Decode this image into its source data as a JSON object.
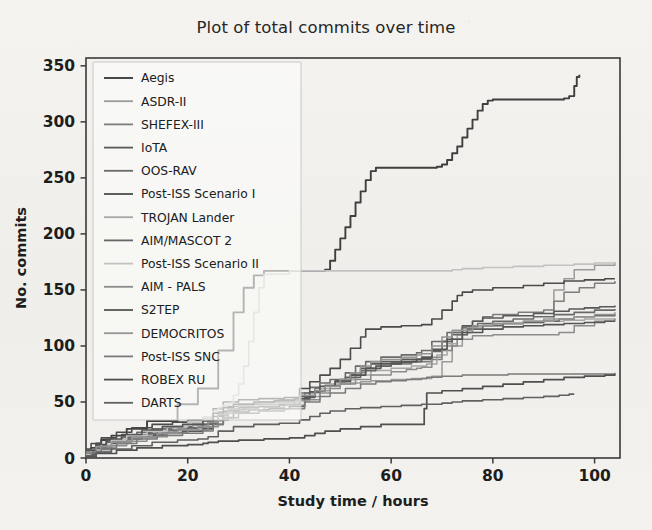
{
  "figure": {
    "title": "Plot of total commits over time",
    "background": "#f2f1ee"
  },
  "chart_data": {
    "type": "line",
    "title": "Plot of total commits over time",
    "xlabel": "Study time / hours",
    "ylabel": "No. commits",
    "xlim": [
      0,
      105
    ],
    "ylim": [
      0,
      357
    ],
    "xticks": [
      0,
      20,
      40,
      60,
      80,
      100
    ],
    "yticks": [
      0,
      50,
      100,
      150,
      200,
      250,
      300,
      350
    ],
    "grid": false,
    "legend_position": "upper left",
    "note": "Cumulative step curves; 15 projects tracked over study hours.",
    "series": [
      {
        "name": "Aegis",
        "color": "#3f3f3f",
        "width": 1.9,
        "x": [
          0,
          1,
          2,
          3,
          5,
          8,
          12,
          18,
          22,
          26,
          29,
          31,
          33,
          35,
          40,
          45,
          47,
          48,
          49,
          50,
          51,
          52,
          53,
          54,
          55,
          56,
          57,
          62,
          66,
          69,
          70,
          71,
          72,
          73,
          74,
          75,
          76,
          77,
          78,
          79,
          80,
          84,
          90,
          94,
          95,
          96,
          96.5,
          97
        ],
        "y": [
          5,
          9,
          13,
          16,
          20,
          26,
          33,
          48,
          62,
          96,
          130,
          152,
          163,
          167,
          167,
          167,
          168,
          176,
          186,
          196,
          206,
          216,
          228,
          238,
          248,
          256,
          259,
          259,
          259,
          260,
          262,
          266,
          272,
          278,
          286,
          294,
          302,
          310,
          316,
          319,
          320,
          320,
          320,
          321,
          323,
          332,
          340,
          342
        ]
      },
      {
        "name": "ASDR-II",
        "color": "#9a9a9a",
        "width": 1.5,
        "x": [
          0,
          1,
          3,
          6,
          9,
          12,
          16,
          20,
          23,
          25,
          27,
          28,
          30,
          33,
          36,
          40,
          44,
          46,
          48,
          50,
          52,
          54,
          56,
          60,
          64,
          68,
          70,
          72,
          74,
          76,
          80,
          86,
          90,
          92,
          94,
          96,
          100,
          104
        ],
        "y": [
          2,
          6,
          11,
          16,
          19,
          21,
          23,
          24,
          27,
          33,
          40,
          44,
          47,
          49,
          50,
          51,
          55,
          60,
          64,
          66,
          67,
          68,
          69,
          70,
          71,
          73,
          86,
          100,
          112,
          118,
          120,
          122,
          124,
          150,
          160,
          168,
          172,
          174
        ]
      },
      {
        "name": "SHEFEX-III",
        "color": "#7d7d7d",
        "width": 1.5,
        "x": [
          0,
          2,
          4,
          7,
          10,
          14,
          18,
          22,
          24,
          26,
          28,
          31,
          34,
          38,
          41,
          43,
          45,
          47,
          50,
          53,
          55,
          57,
          60,
          64,
          68,
          70,
          72,
          74,
          76,
          78,
          80,
          85,
          90,
          92,
          94,
          97,
          100,
          104
        ],
        "y": [
          4,
          9,
          14,
          18,
          21,
          24,
          26,
          28,
          31,
          38,
          43,
          45,
          46,
          47,
          52,
          58,
          62,
          65,
          70,
          76,
          80,
          82,
          84,
          86,
          88,
          96,
          106,
          116,
          122,
          126,
          128,
          130,
          132,
          140,
          148,
          152,
          156,
          158
        ]
      },
      {
        "name": "IoTA",
        "color": "#585858",
        "width": 1.6,
        "x": [
          0,
          2,
          5,
          8,
          11,
          15,
          19,
          23,
          25,
          27,
          29,
          32,
          36,
          40,
          43,
          45,
          47,
          49,
          52,
          54,
          56,
          58,
          62,
          66,
          68,
          70,
          72,
          74,
          76,
          78,
          82,
          88,
          92,
          95,
          98,
          101,
          104
        ],
        "y": [
          3,
          8,
          13,
          17,
          20,
          22,
          24,
          26,
          30,
          36,
          41,
          43,
          44,
          46,
          54,
          60,
          64,
          68,
          74,
          80,
          84,
          86,
          88,
          90,
          96,
          104,
          112,
          118,
          122,
          125,
          127,
          129,
          131,
          133,
          134,
          135,
          136
        ]
      },
      {
        "name": "OOS-RAV",
        "color": "#6a6a6a",
        "width": 1.6,
        "x": [
          0,
          2,
          4,
          7,
          10,
          13,
          17,
          21,
          24,
          26,
          28,
          30,
          34,
          38,
          42,
          44,
          46,
          48,
          51,
          53,
          55,
          58,
          62,
          65,
          66,
          68,
          71,
          74,
          77,
          80,
          84,
          88,
          92,
          96,
          100,
          104
        ],
        "y": [
          6,
          11,
          15,
          19,
          23,
          26,
          28,
          30,
          33,
          41,
          46,
          48,
          50,
          52,
          58,
          63,
          67,
          70,
          76,
          82,
          86,
          90,
          92,
          94,
          96,
          104,
          112,
          117,
          120,
          122,
          124,
          126,
          128,
          130,
          132,
          133
        ]
      },
      {
        "name": "Post-ISS Scenario I",
        "color": "#4b4b4b",
        "width": 1.6,
        "x": [
          0,
          1,
          3,
          6,
          9,
          13,
          17,
          20,
          23,
          25,
          27,
          30,
          34,
          39,
          42,
          44,
          46,
          48,
          50,
          52,
          54,
          55,
          58,
          62,
          66,
          68,
          70,
          72,
          73,
          74,
          76,
          80,
          86,
          90,
          94,
          98,
          102,
          104
        ],
        "y": [
          8,
          13,
          18,
          23,
          27,
          30,
          32,
          34,
          36,
          44,
          50,
          52,
          53,
          54,
          62,
          68,
          74,
          80,
          88,
          98,
          108,
          115,
          117,
          118,
          119,
          124,
          132,
          140,
          145,
          148,
          150,
          152,
          154,
          156,
          158,
          159,
          160,
          160
        ]
      },
      {
        "name": "TROJAN Lander",
        "color": "#a6a6a6",
        "width": 1.5,
        "x": [
          0,
          2,
          5,
          9,
          13,
          17,
          21,
          24,
          26,
          28,
          30,
          33,
          37,
          41,
          44,
          46,
          48,
          50,
          53,
          56,
          60,
          64,
          67,
          69,
          71,
          73,
          75,
          78,
          82,
          86,
          90,
          94,
          98,
          102,
          104
        ],
        "y": [
          5,
          10,
          15,
          20,
          24,
          27,
          29,
          32,
          39,
          44,
          47,
          49,
          50,
          52,
          58,
          62,
          66,
          70,
          74,
          78,
          80,
          82,
          84,
          92,
          102,
          110,
          116,
          119,
          120,
          121,
          122,
          123,
          124,
          124,
          125
        ]
      },
      {
        "name": "AIM/MASCOT 2",
        "color": "#656565",
        "width": 1.6,
        "x": [
          0,
          2,
          4,
          8,
          12,
          16,
          20,
          23,
          25,
          27,
          30,
          34,
          38,
          42,
          45,
          47,
          49,
          51,
          54,
          57,
          60,
          64,
          66,
          68,
          70,
          72,
          75,
          78,
          82,
          86,
          90,
          93,
          96,
          100,
          104
        ],
        "y": [
          4,
          9,
          14,
          19,
          22,
          25,
          27,
          30,
          37,
          42,
          45,
          46,
          48,
          55,
          60,
          64,
          68,
          72,
          78,
          82,
          85,
          86,
          88,
          95,
          104,
          110,
          115,
          118,
          120,
          121,
          122,
          124,
          126,
          127,
          128
        ]
      },
      {
        "name": "Post-ISS Scenario II",
        "color": "#c2c2c2",
        "width": 1.6,
        "x": [
          0,
          1,
          3,
          5,
          8,
          12,
          16,
          20,
          23,
          25,
          26,
          27,
          28,
          29,
          30,
          31,
          32,
          33,
          34,
          35,
          40,
          45,
          50,
          55,
          60,
          64,
          68,
          70,
          72,
          74,
          78,
          84,
          90,
          96,
          100,
          104
        ],
        "y": [
          3,
          7,
          12,
          16,
          20,
          24,
          28,
          32,
          36,
          42,
          45,
          47,
          49,
          56,
          66,
          82,
          104,
          130,
          152,
          164,
          167,
          167,
          167,
          167,
          167,
          167,
          167,
          167,
          168,
          169,
          170,
          171,
          172,
          173,
          174,
          175
        ]
      },
      {
        "name": "AIM - PALS",
        "color": "#8c8c8c",
        "width": 1.5,
        "x": [
          0,
          2,
          5,
          8,
          12,
          16,
          20,
          24,
          26,
          28,
          31,
          35,
          39,
          43,
          46,
          48,
          50,
          53,
          56,
          60,
          63,
          65,
          66,
          68,
          70,
          73,
          76,
          80,
          85,
          90,
          93,
          96,
          100,
          104
        ],
        "y": [
          2,
          6,
          11,
          15,
          19,
          22,
          25,
          28,
          34,
          40,
          43,
          45,
          47,
          52,
          58,
          62,
          66,
          70,
          74,
          77,
          79,
          80,
          81,
          90,
          100,
          106,
          109,
          110,
          110,
          110,
          112,
          118,
          122,
          124
        ]
      },
      {
        "name": "S2TEP",
        "color": "#545454",
        "width": 1.6,
        "x": [
          0,
          2,
          4,
          7,
          11,
          15,
          19,
          23,
          25,
          27,
          29,
          33,
          37,
          41,
          44,
          46,
          49,
          52,
          55,
          58,
          62,
          65,
          66,
          68,
          71,
          74,
          78,
          82,
          86,
          90,
          94,
          98,
          102,
          104
        ],
        "y": [
          7,
          12,
          17,
          21,
          25,
          28,
          30,
          33,
          40,
          45,
          48,
          50,
          51,
          53,
          59,
          64,
          69,
          74,
          80,
          84,
          86,
          88,
          89,
          97,
          106,
          112,
          115,
          117,
          118,
          119,
          120,
          121,
          122,
          122
        ]
      },
      {
        "name": "DEMOCRITOS",
        "color": "#949494",
        "width": 1.5,
        "x": [
          0,
          2,
          5,
          9,
          14,
          18,
          22,
          24,
          26,
          28,
          30,
          34,
          38,
          42,
          45,
          47,
          50,
          52,
          54,
          56,
          58,
          62,
          65,
          66,
          68,
          70,
          72,
          76,
          80,
          86,
          92,
          96,
          100,
          104
        ],
        "y": [
          5,
          10,
          14,
          18,
          22,
          25,
          28,
          32,
          39,
          44,
          46,
          48,
          50,
          56,
          60,
          64,
          70,
          76,
          82,
          86,
          88,
          90,
          92,
          93,
          100,
          108,
          114,
          118,
          120,
          122,
          124,
          126,
          128,
          130
        ]
      },
      {
        "name": "Post-ISS SNC",
        "color": "#7a7a7a",
        "width": 1.5,
        "x": [
          0,
          1,
          3,
          6,
          10,
          14,
          19,
          23,
          25,
          27,
          30,
          34,
          39,
          43,
          46,
          48,
          51,
          54,
          57,
          60,
          63,
          65,
          66,
          67,
          70,
          74,
          78,
          83,
          88,
          92,
          96,
          100,
          104
        ],
        "y": [
          1,
          5,
          9,
          13,
          17,
          20,
          22,
          24,
          30,
          36,
          40,
          42,
          44,
          50,
          55,
          58,
          62,
          66,
          68,
          69,
          70,
          70,
          71,
          72,
          73,
          74,
          74,
          75,
          75,
          75,
          75,
          75,
          76
        ]
      },
      {
        "name": "ROBEX RU",
        "color": "#4f4f4f",
        "width": 1.7,
        "x": [
          0,
          2,
          6,
          10,
          15,
          20,
          23,
          24,
          26,
          30,
          35,
          40,
          43,
          45,
          47,
          50,
          54,
          58,
          62,
          65,
          66,
          66.5,
          67,
          70,
          74,
          78,
          82,
          86,
          90,
          94,
          98,
          102,
          104
        ],
        "y": [
          1,
          4,
          7,
          9,
          11,
          12,
          13,
          14,
          15,
          16,
          17,
          18,
          20,
          22,
          24,
          26,
          28,
          30,
          30,
          30,
          30,
          44,
          58,
          60,
          62,
          64,
          66,
          68,
          70,
          72,
          73,
          74,
          75
        ]
      },
      {
        "name": "DARTS",
        "color": "#606060",
        "width": 1.6,
        "x": [
          0,
          2,
          5,
          9,
          13,
          18,
          22,
          24,
          26,
          29,
          33,
          38,
          42,
          44,
          46,
          48,
          51,
          54,
          58,
          62,
          66,
          68,
          70,
          72,
          74,
          78,
          82,
          86,
          90,
          93,
          95,
          96
        ],
        "y": [
          2,
          5,
          8,
          11,
          14,
          16,
          17,
          19,
          24,
          28,
          30,
          31,
          34,
          37,
          40,
          42,
          44,
          45,
          46,
          47,
          48,
          48,
          49,
          50,
          51,
          52,
          53,
          54,
          55,
          56,
          57,
          57
        ]
      }
    ]
  }
}
